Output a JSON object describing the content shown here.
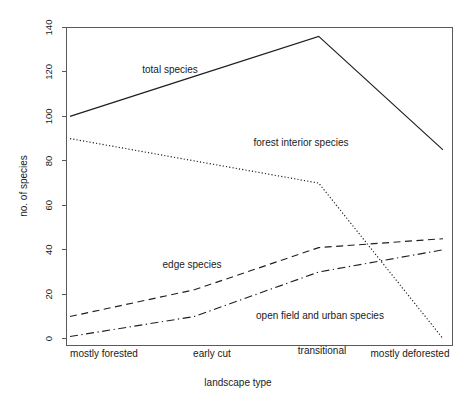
{
  "chart_data": {
    "type": "line",
    "title": "",
    "xlabel": "landscape type",
    "ylabel": "no. of species",
    "categories": [
      "mostly forested",
      "early cut",
      "transitional",
      "mostly deforested"
    ],
    "ylim": [
      0,
      140
    ],
    "yticks": [
      0,
      20,
      40,
      60,
      80,
      100,
      120,
      140
    ],
    "ytick_labels": [
      "0",
      "20",
      "40",
      "60",
      "80",
      "100",
      "120",
      "140"
    ],
    "grid": false,
    "legend": "inline-annotations",
    "series": [
      {
        "name": "total species",
        "line_style": "solid",
        "values": [
          100,
          118,
          136,
          85
        ],
        "label": "total species",
        "label_x": 170,
        "label_y": 73
      },
      {
        "name": "forest interior species",
        "line_style": "dotted",
        "values": [
          90,
          80,
          70,
          0
        ],
        "label": "forest interior species",
        "label_x": 301,
        "label_y": 146
      },
      {
        "name": "edge species",
        "line_style": "dashed",
        "values": [
          10,
          22,
          41,
          45
        ],
        "label": "edge species",
        "label_x": 192,
        "label_y": 268
      },
      {
        "name": "open field and urban species",
        "line_style": "dashdot",
        "values": [
          1,
          10,
          30,
          40
        ],
        "label": "open field and urban species",
        "label_x": 320,
        "label_y": 319
      }
    ]
  },
  "axes": {
    "y_title": "no. of species",
    "x_title": "landscape type",
    "y_ticks": [
      {
        "value": "140"
      },
      {
        "value": "120"
      },
      {
        "value": "100"
      },
      {
        "value": "80"
      },
      {
        "value": "60"
      },
      {
        "value": "40"
      },
      {
        "value": "20"
      },
      {
        "value": "0"
      }
    ],
    "x_ticks": [
      {
        "label": "mostly forested"
      },
      {
        "label": "early cut"
      },
      {
        "label": "transitional"
      },
      {
        "label": "mostly deforested"
      }
    ]
  },
  "colors": {
    "line": "#1f1f1f",
    "axis": "#5a5a5a",
    "background": "#ffffff",
    "text": "#1a1a1a"
  }
}
